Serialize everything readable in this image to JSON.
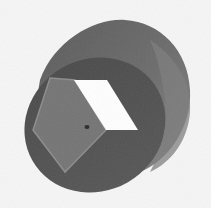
{
  "image": {
    "subject": "3D rendered cylinder with square through-hole",
    "style": "grayscale render",
    "colors": {
      "background": "#f6f6f6",
      "front_face": "#4d4d4d",
      "front_face_edge": "#3f3f3f",
      "side_body": "#6e6e6e",
      "side_body_highlight": "#8a8a8a",
      "inner_wall": "#747474",
      "inner_wall_edge": "#8c8c8c",
      "hole_through": "#ffffff",
      "speck": "#2a2a2a"
    }
  }
}
